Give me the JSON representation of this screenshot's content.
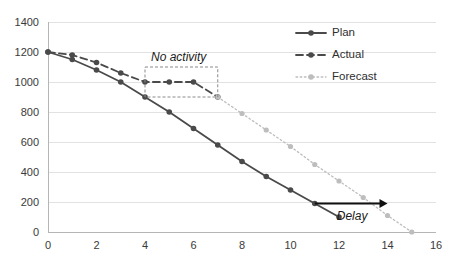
{
  "chart_data": {
    "type": "line",
    "title": "",
    "xlabel": "",
    "ylabel": "",
    "xlim": [
      0,
      16
    ],
    "ylim": [
      0,
      1400
    ],
    "xticks": [
      0,
      2,
      4,
      6,
      8,
      10,
      12,
      14,
      16
    ],
    "yticks": [
      0,
      200,
      400,
      600,
      800,
      1000,
      1200,
      1400
    ],
    "grid": "horizontal",
    "legend_position": "top-right",
    "series": [
      {
        "name": "Plan",
        "style": "solid",
        "color": "#4a4a4a",
        "marker": "circle",
        "x": [
          0,
          1,
          2,
          3,
          4,
          5,
          6,
          7,
          8,
          9,
          10,
          11,
          12
        ],
        "values": [
          1200,
          1150,
          1080,
          1000,
          900,
          800,
          690,
          580,
          470,
          370,
          280,
          190,
          100
        ]
      },
      {
        "name": "Actual",
        "style": "dashed",
        "color": "#4a4a4a",
        "marker": "circle",
        "x": [
          0,
          1,
          2,
          3,
          4,
          5,
          6,
          7
        ],
        "values": [
          1200,
          1180,
          1130,
          1060,
          1000,
          1000,
          1000,
          900
        ]
      },
      {
        "name": "Forecast",
        "style": "dotted",
        "color": "#bdbdbd",
        "marker": "circle",
        "x": [
          7,
          8,
          9,
          10,
          11,
          12,
          13,
          14,
          15
        ],
        "values": [
          900,
          790,
          680,
          570,
          450,
          340,
          230,
          110,
          0
        ]
      }
    ],
    "annotations": [
      {
        "id": "no-activity",
        "label": "No activity",
        "type": "boxed-label",
        "box_x": [
          4,
          7
        ],
        "box_y": [
          900,
          1100
        ]
      },
      {
        "id": "delay",
        "label": "Delay",
        "type": "arrow",
        "arrow_from": [
          11,
          190
        ],
        "arrow_to": [
          14,
          190
        ]
      }
    ]
  },
  "legend": {
    "items": [
      {
        "label": "Plan"
      },
      {
        "label": "Actual"
      },
      {
        "label": "Forecast"
      }
    ]
  },
  "axes": {
    "x_tick_labels": [
      "0",
      "2",
      "4",
      "6",
      "8",
      "10",
      "12",
      "14",
      "16"
    ],
    "y_tick_labels": [
      "0",
      "200",
      "400",
      "600",
      "800",
      "1000",
      "1200",
      "1400"
    ]
  },
  "annotations": {
    "no_activity": "No activity",
    "delay": "Delay"
  },
  "colors": {
    "plan": "#4a4a4a",
    "actual": "#4a4a4a",
    "forecast": "#bdbdbd",
    "grid": "#e2e2e2",
    "axis": "#b5b5b5",
    "text": "#3a3a3a"
  }
}
